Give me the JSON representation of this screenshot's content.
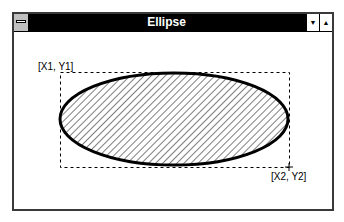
{
  "window": {
    "title": "Ellipse",
    "controls": {
      "system_menu_icon": "system-menu-icon",
      "minimize_icon": "minimize-icon",
      "maximize_icon": "maximize-icon",
      "minimize_glyph": "▼",
      "maximize_glyph": "▲"
    }
  },
  "drawing": {
    "shape": "ellipse",
    "fill_pattern": "diagonal-hatch",
    "bounding_box": {
      "style": "dashed",
      "corner1_label": "[X1, Y1]",
      "corner2_label": "[X2, Y2]"
    },
    "colors": {
      "outline": "#000000",
      "hatch": "#000000",
      "background": "#ffffff"
    }
  }
}
